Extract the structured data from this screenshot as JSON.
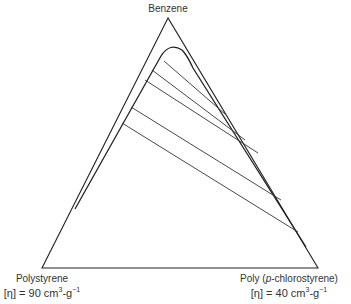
{
  "diagram": {
    "type": "ternary phase diagram",
    "vertices": {
      "top": {
        "label": "Benzene"
      },
      "bottom_left": {
        "label": "Polystyrene",
        "viscosity_prefix": "[η] = 90 cm",
        "exp1": "3",
        "mid": "-g",
        "exp2": "−1"
      },
      "bottom_right": {
        "label_pre": "Poly (",
        "label_italic": "p",
        "label_post": "-chlorostyrene)",
        "viscosity_prefix": "[η] = 40 cm",
        "exp1": "3",
        "mid": "-g",
        "exp2": "−1"
      }
    },
    "binodal_curve": "two-phase region bounded by curve near the polymer–polymer axis",
    "tie_lines_count": 5,
    "colors": {
      "line": "#222222",
      "background": "#ffffff"
    }
  }
}
